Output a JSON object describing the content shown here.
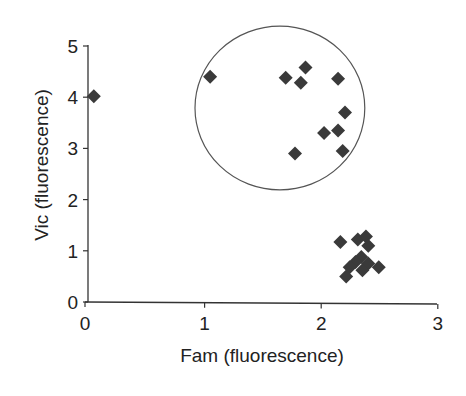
{
  "chart_data": {
    "type": "scatter",
    "title": "",
    "xlabel": "Fam (fluorescence)",
    "ylabel": "Vic (fluorescence)",
    "xlim": [
      0,
      3
    ],
    "ylim": [
      0,
      5
    ],
    "x_ticks": [
      "0",
      "1",
      "2",
      "3"
    ],
    "y_ticks": [
      "0",
      "1",
      "2",
      "3",
      "4",
      "5"
    ],
    "grid": false,
    "legend": null,
    "marker": "diamond",
    "marker_color": "#3a3a3a",
    "series": [
      {
        "name": "outlier",
        "points": [
          {
            "x": 0.05,
            "y": 4.02
          }
        ]
      },
      {
        "name": "circled cluster",
        "points": [
          {
            "x": 1.05,
            "y": 4.4
          },
          {
            "x": 1.7,
            "y": 4.38
          },
          {
            "x": 1.87,
            "y": 4.58
          },
          {
            "x": 1.83,
            "y": 4.28
          },
          {
            "x": 2.15,
            "y": 4.36
          },
          {
            "x": 2.21,
            "y": 3.7
          },
          {
            "x": 2.03,
            "y": 3.3
          },
          {
            "x": 2.15,
            "y": 3.35
          },
          {
            "x": 2.19,
            "y": 2.95
          },
          {
            "x": 1.78,
            "y": 2.9
          }
        ]
      },
      {
        "name": "lower-right cluster",
        "points": [
          {
            "x": 2.17,
            "y": 1.17
          },
          {
            "x": 2.32,
            "y": 1.22
          },
          {
            "x": 2.39,
            "y": 1.28
          },
          {
            "x": 2.41,
            "y": 1.1
          },
          {
            "x": 2.35,
            "y": 0.88
          },
          {
            "x": 2.3,
            "y": 0.78
          },
          {
            "x": 2.41,
            "y": 0.75
          },
          {
            "x": 2.25,
            "y": 0.68
          },
          {
            "x": 2.5,
            "y": 0.68
          },
          {
            "x": 2.36,
            "y": 0.62
          },
          {
            "x": 2.22,
            "y": 0.5
          }
        ]
      }
    ],
    "annotations": [
      {
        "type": "circle",
        "center": {
          "x": 1.65,
          "y": 3.75
        },
        "radius_x": 0.73,
        "radius_y": 1.6,
        "label": ""
      }
    ]
  }
}
